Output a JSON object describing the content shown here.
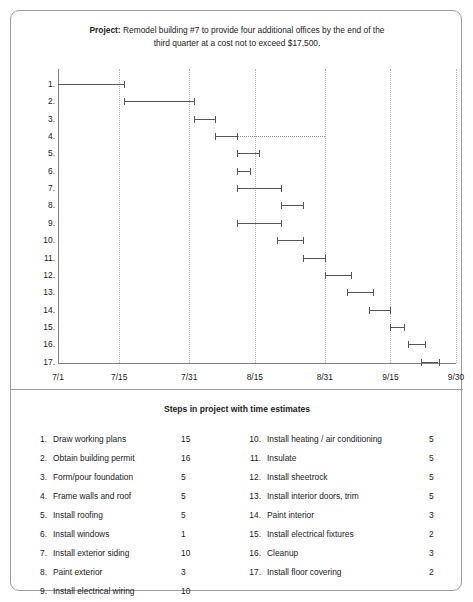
{
  "project": {
    "label": "Project:",
    "line1": "Remodel building #7 to provide four additional offices by the",
    "line2": "end of the third quarter at a cost not to exceed $17,500."
  },
  "chart_data": {
    "type": "bar",
    "title": "Remodel building #7 to provide four additional offices by the end of the third quarter at a cost not to exceed $17,500.",
    "orientation": "horizontal",
    "xlabel": "",
    "ylabel": "",
    "grid": true,
    "legend": "none",
    "x_axis": {
      "ticks": [
        "7/1",
        "7/15",
        "7/31",
        "8/15",
        "8/31",
        "9/15",
        "9/30"
      ],
      "tick_days": [
        0,
        14,
        30,
        45,
        61,
        76,
        91
      ],
      "range_days": [
        0,
        91
      ]
    },
    "y_axis": {
      "categories": [
        "1.",
        "2.",
        "3.",
        "4.",
        "5.",
        "6.",
        "7.",
        "8.",
        "9.",
        "10.",
        "11.",
        "12.",
        "13.",
        "14.",
        "15.",
        "16.",
        "17."
      ]
    },
    "bars": [
      {
        "row": "1.",
        "task": "Draw working plans",
        "start_day": 0,
        "end_day": 15,
        "duration": 15,
        "leader_to_day": null
      },
      {
        "row": "2.",
        "task": "Obtain building permit",
        "start_day": 15,
        "end_day": 31,
        "duration": 16,
        "leader_to_day": null
      },
      {
        "row": "3.",
        "task": "Form/pour foundation",
        "start_day": 31,
        "end_day": 36,
        "duration": 5,
        "leader_to_day": null
      },
      {
        "row": "4.",
        "task": "Frame walls and roof",
        "start_day": 36,
        "end_day": 41,
        "duration": 5,
        "leader_to_day": 61
      },
      {
        "row": "5.",
        "task": "Install roofing",
        "start_day": 41,
        "end_day": 46,
        "duration": 5,
        "leader_to_day": null
      },
      {
        "row": "6.",
        "task": "Install windows",
        "start_day": 41,
        "end_day": 44,
        "duration": 1,
        "leader_to_day": null
      },
      {
        "row": "7.",
        "task": "Install exterior siding",
        "start_day": 41,
        "end_day": 51,
        "duration": 10,
        "leader_to_day": null
      },
      {
        "row": "8.",
        "task": "Paint exterior",
        "start_day": 51,
        "end_day": 56,
        "duration": 3,
        "leader_to_day": null
      },
      {
        "row": "9.",
        "task": "Install electrical wiring",
        "start_day": 41,
        "end_day": 51,
        "duration": 10,
        "leader_to_day": null
      },
      {
        "row": "10.",
        "task": "Install heating / air conditioning",
        "start_day": 50,
        "end_day": 56,
        "duration": 5,
        "leader_to_day": null
      },
      {
        "row": "11.",
        "task": "Insulate",
        "start_day": 56,
        "end_day": 61,
        "duration": 5,
        "leader_to_day": null
      },
      {
        "row": "12.",
        "task": "Install sheetrock",
        "start_day": 61,
        "end_day": 67,
        "duration": 5,
        "leader_to_day": null
      },
      {
        "row": "13.",
        "task": "Install interior doors, trim",
        "start_day": 66,
        "end_day": 72,
        "duration": 5,
        "leader_to_day": null
      },
      {
        "row": "14.",
        "task": "Paint interior",
        "start_day": 71,
        "end_day": 76,
        "duration": 3,
        "leader_to_day": null
      },
      {
        "row": "15.",
        "task": "Install electrical fixtures",
        "start_day": 76,
        "end_day": 79,
        "duration": 2,
        "leader_to_day": null
      },
      {
        "row": "16.",
        "task": "Cleanup",
        "start_day": 80,
        "end_day": 84,
        "duration": 3,
        "leader_to_day": null
      },
      {
        "row": "17.",
        "task": "Install floor covering",
        "start_day": 83,
        "end_day": 87,
        "duration": 2,
        "leader_to_day": null
      }
    ]
  },
  "steps": {
    "title": "Steps in project with time estimates",
    "left": [
      {
        "num": "1.",
        "name": "Draw working plans",
        "days": "15"
      },
      {
        "num": "2.",
        "name": "Obtain building permit",
        "days": "16"
      },
      {
        "num": "3.",
        "name": "Form/pour foundation",
        "days": "5"
      },
      {
        "num": "4.",
        "name": "Frame walls and roof",
        "days": "5"
      },
      {
        "num": "5.",
        "name": "Install roofing",
        "days": "5"
      },
      {
        "num": "6.",
        "name": "Install windows",
        "days": "1"
      },
      {
        "num": "7.",
        "name": "Install exterior siding",
        "days": "10"
      },
      {
        "num": "8.",
        "name": "Paint exterior",
        "days": "3"
      },
      {
        "num": "9.",
        "name": "Install electrical wiring",
        "days": "10"
      }
    ],
    "right": [
      {
        "num": "10.",
        "name": "Install heating / air conditioning",
        "days": "5"
      },
      {
        "num": "11.",
        "name": "Insulate",
        "days": "5"
      },
      {
        "num": "12.",
        "name": "Install sheetrock",
        "days": "5"
      },
      {
        "num": "13.",
        "name": "Install interior doors, trim",
        "days": "5"
      },
      {
        "num": "14.",
        "name": "Paint interior",
        "days": "3"
      },
      {
        "num": "15.",
        "name": "Install electrical fixtures",
        "days": "2"
      },
      {
        "num": "16.",
        "name": "Cleanup",
        "days": "3"
      },
      {
        "num": "17.",
        "name": "Install floor covering",
        "days": "2"
      }
    ]
  },
  "colors": {
    "bar": "#55565a",
    "grid": "#b4b4b4",
    "axis": "#808080",
    "border": "#9c9c9c",
    "text": "#1b1b1b"
  }
}
